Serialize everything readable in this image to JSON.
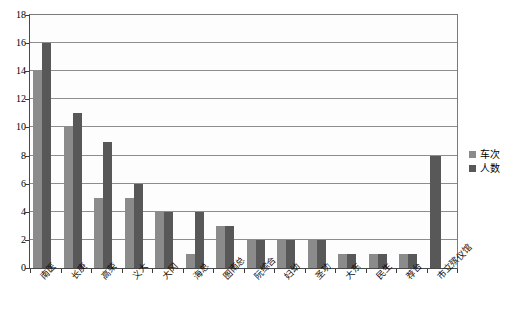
{
  "chart_data": {
    "type": "bar",
    "title": "",
    "subtitle": "",
    "xlabel": "",
    "ylabel": "",
    "ylim": [
      0,
      18
    ],
    "ytick_step": 2,
    "yticks": [
      0,
      2,
      4,
      6,
      8,
      10,
      12,
      14,
      16,
      18
    ],
    "grid": true,
    "legend_position": "right",
    "categories": [
      "南医",
      "长庚",
      "高荣",
      "义大",
      "大冈",
      "海总",
      "图南总",
      "阮综合",
      "妇幼",
      "圣功",
      "大东",
      "民生",
      "荐台",
      "市立殡仪馆"
    ],
    "series": [
      {
        "name": "车次",
        "color": "#8b8b8b",
        "values": [
          14,
          10,
          5,
          5,
          4,
          1,
          3,
          2,
          2,
          2,
          1,
          1,
          1,
          0
        ]
      },
      {
        "name": "人数",
        "color": "#585858",
        "values": [
          16,
          11,
          9,
          6,
          4,
          4,
          3,
          2,
          2,
          2,
          1,
          1,
          1,
          8
        ]
      }
    ],
    "legend": [
      "车次",
      "人数"
    ]
  },
  "colors": {
    "series_0": "#8b8b8b",
    "series_1": "#585858",
    "gridline": "#8d8d8d",
    "axis": "#4a4a4a",
    "plot_background": "#fdfdfd",
    "page_background": "#ffffff"
  }
}
